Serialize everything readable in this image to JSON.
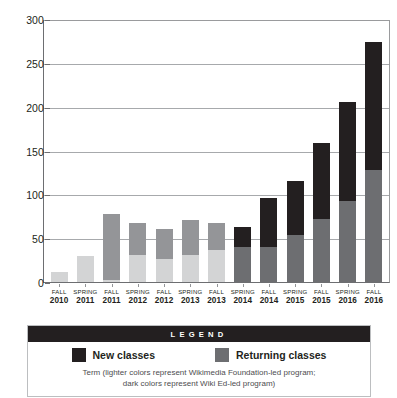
{
  "chart_data": {
    "type": "bar",
    "title": "",
    "xlabel": "Term",
    "ylabel": "",
    "ylim": [
      0,
      300
    ],
    "yticks": [
      0,
      50,
      100,
      150,
      200,
      250,
      300
    ],
    "ytick_labels": [
      "0",
      "50",
      "100",
      "150",
      "200",
      "250",
      "300"
    ],
    "grid": true,
    "stacked": true,
    "legend_position": "bottom",
    "categories": [
      "FALL 2010",
      "SPRING 2011",
      "FALL 2011",
      "SPRING 2012",
      "FALL 2012",
      "SPRING 2013",
      "FALL 2013",
      "SPRING 2014",
      "FALL 2014",
      "SPRING 2015",
      "FALL 2015",
      "SPRING 2016",
      "FALL 2016"
    ],
    "series": [
      {
        "name": "Returning classes",
        "values": [
          13,
          31,
          4,
          32,
          27,
          32,
          38,
          41,
          41,
          55,
          73,
          93,
          129
        ]
      },
      {
        "name": "New classes",
        "values": [
          0,
          0,
          75,
          36,
          35,
          40,
          30,
          23,
          56,
          61,
          87,
          113,
          146
        ]
      }
    ],
    "totals": [
      13,
      31,
      79,
      68,
      62,
      72,
      68,
      64,
      97,
      116,
      160,
      206,
      275
    ]
  },
  "axis": {
    "terms": [
      {
        "term": "FALL",
        "year": "2010"
      },
      {
        "term": "SPRING",
        "year": "2011"
      },
      {
        "term": "FALL",
        "year": "2011"
      },
      {
        "term": "SPRING",
        "year": "2012"
      },
      {
        "term": "FALL",
        "year": "2012"
      },
      {
        "term": "SPRING",
        "year": "2013"
      },
      {
        "term": "FALL",
        "year": "2013"
      },
      {
        "term": "SPRING",
        "year": "2014"
      },
      {
        "term": "FALL",
        "year": "2014"
      },
      {
        "term": "SPRING",
        "year": "2015"
      },
      {
        "term": "FALL",
        "year": "2015"
      },
      {
        "term": "SPRING",
        "year": "2016"
      },
      {
        "term": "FALL",
        "year": "2016"
      }
    ]
  },
  "bars": [
    {
      "term": "FALL",
      "year": "2010",
      "returning": 13,
      "new": 0,
      "era": "light"
    },
    {
      "term": "SPRING",
      "year": "2011",
      "returning": 31,
      "new": 0,
      "era": "light"
    },
    {
      "term": "FALL",
      "year": "2011",
      "returning": 4,
      "new": 75,
      "era": "light"
    },
    {
      "term": "SPRING",
      "year": "2012",
      "returning": 32,
      "new": 36,
      "era": "light"
    },
    {
      "term": "FALL",
      "year": "2012",
      "returning": 27,
      "new": 35,
      "era": "light"
    },
    {
      "term": "SPRING",
      "year": "2013",
      "returning": 32,
      "new": 40,
      "era": "light"
    },
    {
      "term": "FALL",
      "year": "2013",
      "returning": 38,
      "new": 30,
      "era": "light"
    },
    {
      "term": "SPRING",
      "year": "2014",
      "returning": 41,
      "new": 23,
      "era": "dark"
    },
    {
      "term": "FALL",
      "year": "2014",
      "returning": 41,
      "new": 56,
      "era": "dark"
    },
    {
      "term": "SPRING",
      "year": "2015",
      "returning": 55,
      "new": 61,
      "era": "dark"
    },
    {
      "term": "FALL",
      "year": "2015",
      "returning": 73,
      "new": 87,
      "era": "dark"
    },
    {
      "term": "SPRING",
      "year": "2016",
      "returning": 93,
      "new": 113,
      "era": "dark"
    },
    {
      "term": "FALL",
      "year": "2016",
      "returning": 129,
      "new": 146,
      "era": "dark"
    }
  ],
  "legend": {
    "header": "LEGEND",
    "items": [
      {
        "label": "New classes",
        "swatch": "#231f20"
      },
      {
        "label": "Returning classes",
        "swatch": "#6d6e71"
      }
    ],
    "caption_line1": "Term (lighter colors represent Wikimedia Foundation-led program;",
    "caption_line2": "dark colors represent Wiki Ed-led program)"
  },
  "colors": {
    "new_dark": "#231f20",
    "returning_dark": "#6d6e71",
    "new_light": "#949598",
    "returning_light": "#d3d4d5",
    "gridline": "#a7a9ac",
    "axis": "#6d6e71",
    "text": "#231f20",
    "caption_text": "#4d4d4f",
    "legend_header_bg": "#231f20",
    "legend_header_text": "#ffffff",
    "legend_border": "#bcbec0",
    "background": "#ffffff"
  }
}
